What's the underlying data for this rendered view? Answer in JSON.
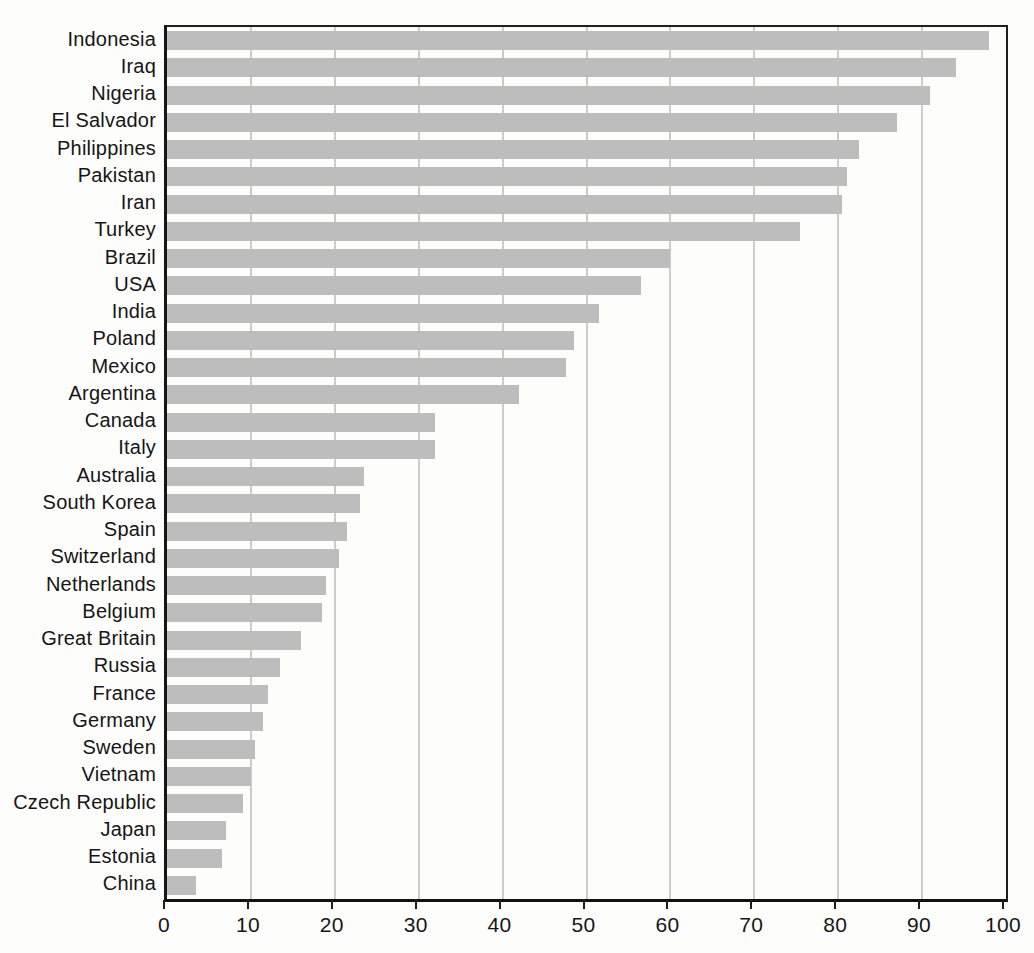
{
  "chart_data": {
    "type": "bar",
    "orientation": "horizontal",
    "title": "",
    "xlabel": "",
    "ylabel": "",
    "xlim": [
      0,
      100
    ],
    "x_ticks": [
      0,
      10,
      20,
      30,
      40,
      50,
      60,
      70,
      80,
      90,
      100
    ],
    "grid": true,
    "legend": "none",
    "sort": "descending",
    "categories": [
      "Indonesia",
      "Iraq",
      "Nigeria",
      "El Salvador",
      "Philippines",
      "Pakistan",
      "Iran",
      "Turkey",
      "Brazil",
      "USA",
      "India",
      "Poland",
      "Mexico",
      "Argentina",
      "Canada",
      "Italy",
      "Australia",
      "South Korea",
      "Spain",
      "Switzerland",
      "Netherlands",
      "Belgium",
      "Great Britain",
      "Russia",
      "France",
      "Germany",
      "Sweden",
      "Vietnam",
      "Czech Republic",
      "Japan",
      "Estonia",
      "China"
    ],
    "values": [
      98,
      94,
      91,
      87,
      82.5,
      81,
      80.5,
      75.5,
      60,
      56.5,
      51.5,
      48.5,
      47.5,
      42,
      32,
      32,
      23.5,
      23,
      21.5,
      20.5,
      19,
      18.5,
      16,
      13.5,
      12,
      11.5,
      10.5,
      10,
      9,
      7,
      6.5,
      3.5
    ],
    "colors": {
      "bar_fill": "#bdbdbd",
      "gridline": "#cccccc",
      "frame": "#1a1a1a",
      "text": "#161616",
      "background": "#fdfdfc"
    }
  }
}
